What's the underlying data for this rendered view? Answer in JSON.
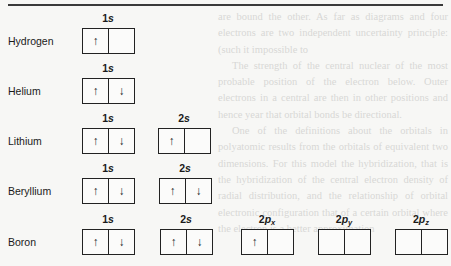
{
  "background_text": [
    "are bound the other. As far as diagrams and four electrons are two independent uncertainty principle: (such it impossible to",
    "The strength of the central nuclear of the most probable position of the electron below. Outer electrons in a central are then in other positions and hence year that orbital bonds be directional.",
    "One of the definitions about the orbitals in polyatomic results from the orbitals of equivalent two dimensions. For this model the hybridization, that is the hybridization of the central electron density of radial distribution, and the relationship of orbital electronic configuration that of a certain orbital where the electron is a better approximation"
  ],
  "elements": [
    {
      "name": "Hydrogen",
      "orbitals": [
        {
          "num": "1",
          "letter": "s",
          "sub": "",
          "cells": [
            "↑",
            ""
          ]
        }
      ]
    },
    {
      "name": "Helium",
      "orbitals": [
        {
          "num": "1",
          "letter": "s",
          "sub": "",
          "cells": [
            "↑",
            "↓"
          ]
        }
      ]
    },
    {
      "name": "Lithium",
      "orbitals": [
        {
          "num": "1",
          "letter": "s",
          "sub": "",
          "cells": [
            "↑",
            "↓"
          ]
        },
        {
          "num": "2",
          "letter": "s",
          "sub": "",
          "cells": [
            "↑",
            ""
          ]
        }
      ]
    },
    {
      "name": "Beryllium",
      "orbitals": [
        {
          "num": "1",
          "letter": "s",
          "sub": "",
          "cells": [
            "↑",
            "↓"
          ]
        },
        {
          "num": "2",
          "letter": "s",
          "sub": "",
          "cells": [
            "↑",
            "↓"
          ]
        }
      ]
    },
    {
      "name": "Boron",
      "orbitals": [
        {
          "num": "1",
          "letter": "s",
          "sub": "",
          "cells": [
            "↑",
            "↓"
          ]
        },
        {
          "num": "2",
          "letter": "s",
          "sub": "",
          "cells": [
            "↑",
            "↓"
          ]
        },
        {
          "num": "2",
          "letter": "p",
          "sub": "x",
          "cells": [
            "↑",
            ""
          ]
        },
        {
          "num": "2",
          "letter": "p",
          "sub": "y",
          "cells": [
            "",
            ""
          ]
        },
        {
          "num": "2",
          "letter": "p",
          "sub": "z",
          "cells": [
            "",
            ""
          ]
        }
      ]
    }
  ]
}
